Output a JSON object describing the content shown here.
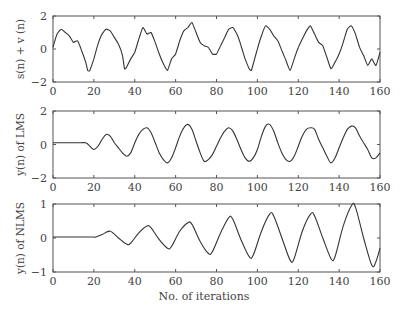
{
  "chart_data": [
    {
      "type": "line",
      "ylabel": "s(n) + v (n)",
      "xlabel": "",
      "xlim": [
        0,
        160
      ],
      "ylim": [
        -2,
        2
      ],
      "xticks": [
        0,
        20,
        40,
        60,
        80,
        100,
        120,
        140,
        160
      ],
      "yticks": [
        -2,
        0,
        2
      ],
      "grid": false,
      "x": [
        0,
        2,
        4,
        6,
        8,
        10,
        12,
        14,
        16,
        17,
        18,
        20,
        22,
        24,
        26,
        28,
        30,
        32,
        34,
        35,
        36,
        38,
        40,
        42,
        44,
        46,
        48,
        50,
        52,
        54,
        56,
        58,
        60,
        62,
        64,
        66,
        68,
        70,
        72,
        74,
        76,
        78,
        80,
        82,
        84,
        86,
        88,
        90,
        92,
        94,
        96,
        97,
        98,
        100,
        102,
        104,
        106,
        108,
        110,
        112,
        114,
        116,
        118,
        120,
        122,
        124,
        126,
        128,
        130,
        132,
        134,
        136,
        138,
        140,
        142,
        144,
        146,
        148,
        150,
        152,
        154,
        156,
        158,
        160
      ],
      "values": [
        0.1,
        0.9,
        1.2,
        1.0,
        0.8,
        0.4,
        0.5,
        -0.1,
        -0.8,
        -1.3,
        -1.3,
        -0.6,
        0.3,
        0.9,
        1.2,
        1.1,
        0.7,
        0.3,
        -0.4,
        -1.2,
        -1.1,
        -0.6,
        -0.2,
        0.6,
        1.3,
        0.9,
        1.0,
        0.4,
        -0.3,
        -0.9,
        -1.3,
        -0.6,
        -0.3,
        0.5,
        1.1,
        1.3,
        1.6,
        1.0,
        0.4,
        0.2,
        0.1,
        -0.3,
        -0.3,
        0.2,
        0.7,
        1.2,
        1.3,
        0.9,
        0.2,
        -0.6,
        -1.2,
        -1.3,
        -0.9,
        0.0,
        0.8,
        1.4,
        1.2,
        0.8,
        0.5,
        -0.1,
        -0.7,
        -1.3,
        -0.6,
        0.1,
        0.6,
        1.1,
        1.4,
        0.9,
        0.4,
        0.2,
        -0.5,
        -1.2,
        -0.8,
        -0.3,
        0.4,
        1.2,
        1.4,
        0.9,
        0.1,
        -0.4,
        -1.0,
        -0.6,
        -1.0,
        -0.2
      ]
    },
    {
      "type": "line",
      "ylabel": "y(n) of LMS",
      "xlabel": "",
      "xlim": [
        0,
        160
      ],
      "ylim": [
        -2,
        2
      ],
      "xticks": [
        0,
        20,
        40,
        60,
        80,
        100,
        120,
        140,
        160
      ],
      "yticks": [
        -2,
        0,
        2
      ],
      "grid": false,
      "x": [
        0,
        4,
        8,
        12,
        16,
        18,
        20,
        22,
        24,
        26,
        28,
        30,
        32,
        34,
        36,
        38,
        40,
        42,
        44,
        46,
        48,
        50,
        52,
        54,
        56,
        58,
        60,
        62,
        64,
        66,
        68,
        70,
        72,
        74,
        76,
        78,
        80,
        82,
        84,
        86,
        88,
        90,
        92,
        94,
        96,
        98,
        100,
        102,
        104,
        106,
        108,
        110,
        112,
        114,
        116,
        118,
        120,
        122,
        124,
        126,
        128,
        130,
        132,
        134,
        136,
        138,
        140,
        142,
        144,
        146,
        148,
        150,
        152,
        154,
        156,
        158,
        160
      ],
      "values": [
        0.1,
        0.1,
        0.1,
        0.1,
        0.1,
        -0.1,
        -0.3,
        -0.1,
        0.3,
        0.6,
        0.5,
        0.1,
        -0.2,
        -0.5,
        -0.7,
        -0.5,
        0.1,
        0.6,
        0.9,
        1.0,
        0.7,
        0.1,
        -0.5,
        -0.9,
        -1.1,
        -0.8,
        -0.2,
        0.5,
        1.0,
        1.2,
        0.9,
        0.2,
        -0.5,
        -1.0,
        -0.9,
        -0.6,
        -0.1,
        0.4,
        0.8,
        1.0,
        0.8,
        0.3,
        -0.3,
        -0.8,
        -1.0,
        -0.8,
        -0.3,
        0.5,
        1.1,
        1.2,
        0.8,
        0.1,
        -0.5,
        -0.9,
        -1.0,
        -0.7,
        -0.1,
        0.5,
        0.9,
        1.0,
        0.9,
        0.3,
        -0.2,
        -0.7,
        -1.1,
        -0.8,
        -0.2,
        0.4,
        0.9,
        1.1,
        1.0,
        0.5,
        0.1,
        -0.3,
        -0.8,
        -0.8,
        -0.5
      ]
    },
    {
      "type": "line",
      "ylabel": "y(n) of NLMS",
      "xlabel": "No. of iterations",
      "xlim": [
        0,
        160
      ],
      "ylim": [
        -1,
        1
      ],
      "xticks": [
        0,
        20,
        40,
        60,
        80,
        100,
        120,
        140,
        160
      ],
      "yticks": [
        -1,
        0,
        1
      ],
      "grid": false,
      "x": [
        0,
        4,
        8,
        12,
        16,
        20,
        21,
        24,
        28,
        32,
        36,
        38,
        42,
        46,
        48,
        52,
        56,
        58,
        62,
        66,
        68,
        72,
        76,
        78,
        82,
        86,
        88,
        92,
        96,
        98,
        102,
        106,
        108,
        112,
        116,
        118,
        122,
        126,
        128,
        132,
        136,
        138,
        142,
        146,
        148,
        152,
        156,
        158,
        160
      ],
      "values": [
        0.03,
        0.03,
        0.03,
        0.03,
        0.03,
        0.03,
        0.03,
        0.1,
        0.2,
        0.0,
        -0.18,
        -0.15,
        0.15,
        0.35,
        0.3,
        -0.05,
        -0.3,
        -0.25,
        0.2,
        0.45,
        0.4,
        -0.1,
        -0.45,
        -0.4,
        0.15,
        0.6,
        0.55,
        -0.05,
        -0.55,
        -0.5,
        0.2,
        0.7,
        0.65,
        0.0,
        -0.65,
        -0.6,
        0.2,
        0.7,
        0.65,
        0.0,
        -0.6,
        -0.55,
        0.35,
        0.95,
        0.9,
        0.0,
        -0.8,
        -0.7,
        -0.3
      ]
    }
  ],
  "layout": {
    "plot_left_px": 53,
    "plot_right_px": 380,
    "panels_px": [
      {
        "top": 16,
        "bottom": 82
      },
      {
        "top": 111,
        "bottom": 178
      },
      {
        "top": 204,
        "bottom": 272
      }
    ],
    "line_color": "#333333",
    "axis_color": "#555555"
  },
  "xlabel": "No. of iterations"
}
